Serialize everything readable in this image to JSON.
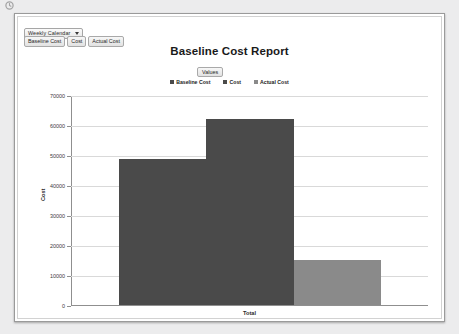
{
  "window": {
    "corner_icon": "app-icon"
  },
  "toolbar": {
    "calendar_select": {
      "value": "Weekly Calendar",
      "caret_icon": "chevron-down-icon"
    },
    "field_buttons": [
      {
        "label": "Baseline Cost"
      },
      {
        "label": "Cost"
      },
      {
        "label": "Actual Cost"
      }
    ]
  },
  "chart_controls": {
    "values_button": "Values"
  },
  "chart_data": {
    "type": "bar",
    "title": "Baseline Cost Report",
    "categories": [
      "Total"
    ],
    "series": [
      {
        "name": "Baseline Cost",
        "values": [
          48800
        ],
        "color": "#4a4a4a"
      },
      {
        "name": "Cost",
        "values": [
          62300
        ],
        "color": "#4a4a4a"
      },
      {
        "name": "Actual Cost",
        "values": [
          15200
        ],
        "color": "#8a8a8a"
      }
    ],
    "xlabel": "",
    "ylabel": "Cost",
    "ylim": [
      0,
      70000
    ],
    "yticks": [
      0,
      10000,
      20000,
      30000,
      40000,
      50000,
      60000,
      70000
    ],
    "ytick_labels": [
      "0",
      "10000",
      "20000",
      "30000",
      "40000",
      "50000",
      "60000",
      "70000"
    ],
    "grid": true,
    "legend_position": "top-center"
  },
  "colors": {
    "panel_border": "#9a9a9a",
    "page_background": "#ececed",
    "axis": "#8f8f8f",
    "gridline": "#d9d9d9"
  }
}
